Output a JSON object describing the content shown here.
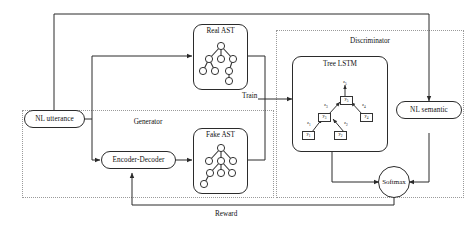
{
  "diagram": {
    "generator": {
      "label": "Generator"
    },
    "discriminator": {
      "label": "Discriminator"
    },
    "nodes": {
      "nl_utterance": "NL utterance",
      "encoder_decoder": "Encoder-Decoder",
      "real_ast": "Real AST",
      "fake_ast": "Fake AST",
      "tree_lstm": "Tree LSTM",
      "nl_semantic": "NL semantic",
      "softmax": "Softmax"
    },
    "edge_labels": {
      "train": "Train",
      "reward": "Reward"
    },
    "tree_lstm_nodes": [
      {
        "id": "y1",
        "text": "y",
        "sub": "1"
      },
      {
        "id": "y2",
        "text": "y",
        "sub": "2"
      },
      {
        "id": "y3",
        "text": "y",
        "sub": "3"
      },
      {
        "id": "y4",
        "text": "y",
        "sub": "4"
      },
      {
        "id": "y5",
        "text": "y",
        "sub": "5"
      }
    ],
    "tree_lstm_edges": [
      {
        "id": "z1",
        "text": "z",
        "sub": "1"
      },
      {
        "id": "z2",
        "text": "z",
        "sub": "2"
      },
      {
        "id": "z3",
        "text": "z",
        "sub": "3"
      },
      {
        "id": "z4",
        "text": "z",
        "sub": "4"
      },
      {
        "id": "z5",
        "text": "z",
        "sub": "5"
      }
    ],
    "colors": {
      "stroke": "#2b2b2b",
      "dashed": "#9a9a9a",
      "background": "#ffffff",
      "text": "#111111"
    }
  }
}
